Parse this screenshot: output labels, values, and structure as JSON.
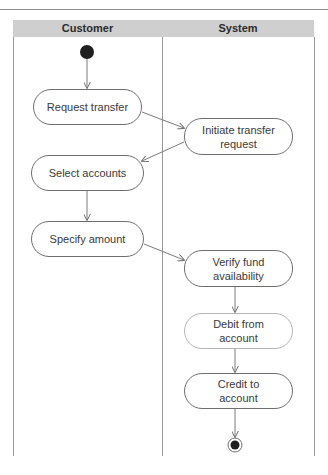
{
  "diagram": {
    "type": "uml-activity-swimlane",
    "lanes": [
      {
        "id": "customer",
        "title": "Customer"
      },
      {
        "id": "system",
        "title": "System"
      }
    ],
    "start_node": {
      "lane": "customer"
    },
    "end_node": {
      "lane": "system"
    },
    "nodes": [
      {
        "id": "request_transfer",
        "lane": "customer",
        "label": "Request transfer"
      },
      {
        "id": "initiate_transfer_request",
        "lane": "system",
        "label": "Initiate transfer\nrequest"
      },
      {
        "id": "select_accounts",
        "lane": "customer",
        "label": "Select accounts"
      },
      {
        "id": "specify_amount",
        "lane": "customer",
        "label": "Specify amount"
      },
      {
        "id": "verify_fund_availability",
        "lane": "system",
        "label": "Verify fund\navailability"
      },
      {
        "id": "debit_from_account",
        "lane": "system",
        "label": "Debit from\naccount"
      },
      {
        "id": "credit_to_account",
        "lane": "system",
        "label": "Credit to\naccount"
      }
    ],
    "edges": [
      {
        "from": "start",
        "to": "request_transfer"
      },
      {
        "from": "request_transfer",
        "to": "initiate_transfer_request"
      },
      {
        "from": "initiate_transfer_request",
        "to": "select_accounts"
      },
      {
        "from": "select_accounts",
        "to": "specify_amount"
      },
      {
        "from": "specify_amount",
        "to": "verify_fund_availability"
      },
      {
        "from": "verify_fund_availability",
        "to": "debit_from_account"
      },
      {
        "from": "debit_from_account",
        "to": "credit_to_account"
      },
      {
        "from": "credit_to_account",
        "to": "end"
      }
    ],
    "colors": {
      "header_band": "#cfcfcf",
      "line": "#6e6e6e",
      "node_fill": "#ffffff",
      "start_fill": "#1e1e1e"
    }
  }
}
